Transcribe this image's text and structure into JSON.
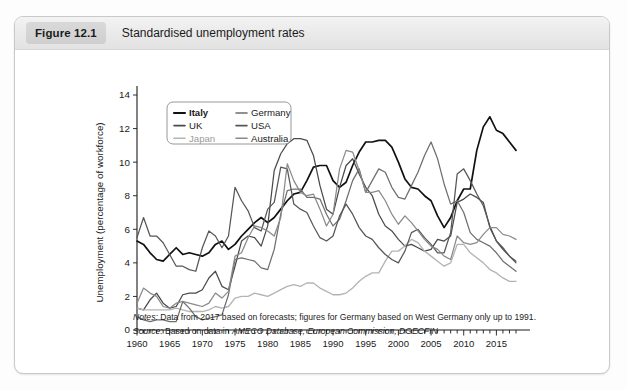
{
  "figure": {
    "badge": "Figure 12.1",
    "title": "Standardised unemployment rates"
  },
  "notes": {
    "notes_label": "Notes:",
    "notes_text": "Data from 2017 based on forecasts; figures for Germany based on West Germany only up to 1991.",
    "source_label": "Source:",
    "source_prefix": "Based on data in ",
    "source_italic": "AMECO Database, European Commission, DGECFIN"
  },
  "colors": {
    "italy": "#111111",
    "uk": "#4a4a4a",
    "japan": "#b4b4b4",
    "germany": "#6e6e6e",
    "usa": "#575757",
    "australia": "#8a8a8a",
    "axis": "#1a1a1a",
    "card_border": "#c9c9c9"
  },
  "chart_data": {
    "type": "line",
    "title": "Standardised unemployment rates",
    "xlabel": "",
    "ylabel": "Unemployment (percentage of workforce)",
    "xlim": [
      1960,
      2018
    ],
    "ylim": [
      0,
      14
    ],
    "yticks": [
      0,
      2,
      4,
      6,
      8,
      10,
      12,
      14
    ],
    "xticks": [
      1960,
      1965,
      1970,
      1975,
      1980,
      1985,
      1990,
      1995,
      2000,
      2005,
      2010,
      2015
    ],
    "x_minor_tick_step": 1,
    "grid": false,
    "legend_position": "top-left-inside",
    "x": [
      1960,
      1961,
      1962,
      1963,
      1964,
      1965,
      1966,
      1967,
      1968,
      1969,
      1970,
      1971,
      1972,
      1973,
      1974,
      1975,
      1976,
      1977,
      1978,
      1979,
      1980,
      1981,
      1982,
      1983,
      1984,
      1985,
      1986,
      1987,
      1988,
      1989,
      1990,
      1991,
      1992,
      1993,
      1994,
      1995,
      1996,
      1997,
      1998,
      1999,
      2000,
      2001,
      2002,
      2003,
      2004,
      2005,
      2006,
      2007,
      2008,
      2009,
      2010,
      2011,
      2012,
      2013,
      2014,
      2015,
      2016,
      2017,
      2018
    ],
    "series": [
      {
        "name": "Italy",
        "color": "#111111",
        "width": 1.7,
        "values": [
          5.3,
          5.1,
          4.6,
          4.2,
          4.1,
          4.5,
          4.9,
          4.5,
          4.6,
          4.5,
          4.4,
          4.6,
          5.1,
          5.3,
          4.8,
          5.1,
          5.6,
          6.0,
          6.4,
          6.7,
          6.4,
          6.7,
          7.2,
          7.7,
          8.1,
          8.2,
          8.9,
          9.7,
          9.8,
          9.8,
          8.9,
          8.5,
          8.8,
          9.8,
          10.6,
          11.2,
          11.2,
          11.3,
          11.3,
          10.9,
          10.0,
          9.0,
          8.5,
          8.4,
          8.0,
          7.7,
          6.8,
          6.1,
          6.7,
          7.7,
          8.4,
          8.4,
          10.7,
          12.1,
          12.7,
          11.9,
          11.7,
          11.2,
          10.7
        ]
      },
      {
        "name": "UK",
        "color": "#4a4a4a",
        "width": 1.25,
        "values": [
          1.3,
          1.2,
          1.8,
          2.2,
          1.6,
          1.3,
          1.4,
          2.1,
          2.2,
          2.2,
          2.4,
          3.1,
          3.5,
          2.6,
          2.4,
          3.8,
          5.3,
          5.6,
          5.5,
          5.0,
          6.2,
          9.5,
          10.5,
          11.1,
          11.4,
          11.4,
          11.3,
          10.4,
          8.6,
          7.2,
          6.9,
          8.5,
          9.8,
          10.2,
          9.3,
          8.5,
          8.0,
          6.9,
          6.2,
          5.9,
          5.4,
          5.0,
          5.1,
          4.9,
          4.7,
          4.8,
          5.4,
          5.3,
          5.6,
          7.6,
          7.8,
          8.1,
          7.9,
          7.6,
          6.1,
          5.3,
          4.8,
          4.4,
          4.1
        ]
      },
      {
        "name": "Japan",
        "color": "#b4b4b4",
        "width": 1.35,
        "values": [
          1.3,
          1.2,
          1.2,
          1.2,
          1.2,
          1.2,
          1.3,
          1.2,
          1.1,
          1.1,
          1.1,
          1.2,
          1.4,
          1.3,
          1.4,
          1.9,
          2.0,
          2.0,
          2.2,
          2.1,
          2.0,
          2.2,
          2.4,
          2.6,
          2.7,
          2.6,
          2.8,
          2.8,
          2.5,
          2.3,
          2.1,
          2.1,
          2.2,
          2.5,
          2.9,
          3.2,
          3.4,
          3.4,
          4.1,
          4.7,
          4.7,
          5.0,
          5.4,
          5.2,
          4.7,
          4.4,
          4.1,
          3.8,
          4.0,
          5.1,
          5.1,
          4.6,
          4.3,
          4.0,
          3.6,
          3.4,
          3.1,
          2.9,
          2.9
        ]
      },
      {
        "name": "Germany",
        "color": "#6e6e6e",
        "width": 1.25,
        "values": [
          0.8,
          0.6,
          0.5,
          0.6,
          0.6,
          0.5,
          0.5,
          1.7,
          1.3,
          0.8,
          0.6,
          0.7,
          0.8,
          0.9,
          2.1,
          4.2,
          4.3,
          4.2,
          4.1,
          3.7,
          3.6,
          4.8,
          6.9,
          8.3,
          8.4,
          8.4,
          7.9,
          7.9,
          7.8,
          6.9,
          6.2,
          6.6,
          7.7,
          8.9,
          9.6,
          8.2,
          8.9,
          9.6,
          9.4,
          8.5,
          7.9,
          7.8,
          8.6,
          9.4,
          10.4,
          11.2,
          10.2,
          8.7,
          7.5,
          7.7,
          7.0,
          5.8,
          5.4,
          5.2,
          5.0,
          4.6,
          4.1,
          3.8,
          3.5
        ]
      },
      {
        "name": "USA",
        "color": "#575757",
        "width": 1.25,
        "values": [
          5.5,
          6.7,
          5.6,
          5.6,
          5.2,
          4.5,
          3.8,
          3.8,
          3.6,
          3.5,
          4.9,
          5.9,
          5.6,
          4.9,
          5.6,
          8.5,
          7.7,
          7.1,
          6.1,
          5.9,
          7.2,
          7.6,
          9.7,
          9.6,
          7.5,
          7.2,
          7.0,
          6.2,
          5.5,
          5.3,
          5.6,
          6.8,
          7.5,
          6.9,
          6.1,
          5.6,
          5.4,
          4.9,
          4.5,
          4.2,
          4.0,
          4.7,
          5.8,
          6.0,
          5.5,
          5.1,
          4.6,
          4.6,
          5.8,
          9.3,
          9.6,
          8.9,
          8.1,
          7.4,
          6.2,
          5.3,
          4.9,
          4.4,
          4.0
        ]
      },
      {
        "name": "Australia",
        "color": "#8a8a8a",
        "width": 1.25,
        "values": [
          1.6,
          2.5,
          2.2,
          2.0,
          1.4,
          1.3,
          1.6,
          1.7,
          1.6,
          1.5,
          1.4,
          1.6,
          2.2,
          1.9,
          2.3,
          4.4,
          4.6,
          5.5,
          6.2,
          6.1,
          5.9,
          5.6,
          6.7,
          9.9,
          8.9,
          8.2,
          8.0,
          8.1,
          7.2,
          6.2,
          6.9,
          9.6,
          10.7,
          10.6,
          9.5,
          8.2,
          8.2,
          8.3,
          7.7,
          6.9,
          6.3,
          6.8,
          6.4,
          5.9,
          5.4,
          5.0,
          4.8,
          4.4,
          4.2,
          5.6,
          5.2,
          5.1,
          5.2,
          5.7,
          6.1,
          6.1,
          5.7,
          5.6,
          5.4
        ]
      }
    ],
    "legend_entries": [
      {
        "label": "Italy",
        "color": "#111111",
        "bold": true,
        "dim": false
      },
      {
        "label": "Germany",
        "color": "#6e6e6e",
        "bold": false,
        "dim": false
      },
      {
        "label": "UK",
        "color": "#4a4a4a",
        "bold": false,
        "dim": false
      },
      {
        "label": "USA",
        "color": "#575757",
        "bold": false,
        "dim": false
      },
      {
        "label": "Japan",
        "color": "#b4b4b4",
        "bold": false,
        "dim": true
      },
      {
        "label": "Australia",
        "color": "#8a8a8a",
        "bold": false,
        "dim": false
      }
    ]
  }
}
